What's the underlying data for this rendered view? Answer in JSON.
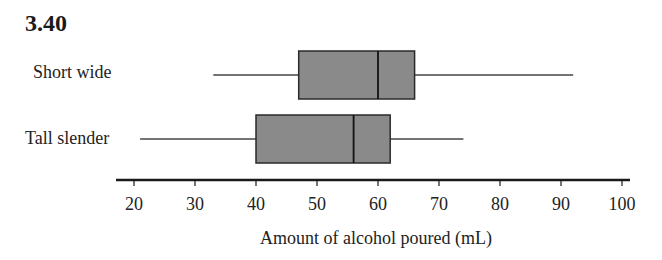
{
  "figure": {
    "number": "3.40"
  },
  "colors": {
    "box_fill": "#8a8a8a",
    "stroke": "#2a2a2a",
    "axis": "#1a1a1a"
  },
  "chart_data": {
    "type": "boxplot",
    "orientation": "horizontal",
    "title": "3.40",
    "xlabel": "Amount of alcohol poured (mL)",
    "ylabel": "",
    "xlim": [
      17,
      102
    ],
    "xticks": [
      20,
      30,
      40,
      50,
      60,
      70,
      80,
      90,
      100
    ],
    "grid": false,
    "legend": null,
    "categories": [
      "Short wide",
      "Tall slender"
    ],
    "series": [
      {
        "name": "Short wide",
        "min": 33,
        "q1": 47,
        "median": 60,
        "q3": 66,
        "max": 92
      },
      {
        "name": "Tall slender",
        "min": 21,
        "q1": 40,
        "median": 56,
        "q3": 62,
        "max": 74
      }
    ]
  }
}
